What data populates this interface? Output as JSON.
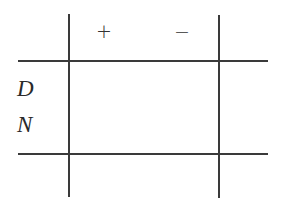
{
  "table": {
    "columns": [
      "+",
      "−"
    ],
    "rows": [
      "D",
      "N"
    ],
    "cells": [
      [
        "",
        ""
      ],
      [
        "",
        ""
      ]
    ]
  }
}
